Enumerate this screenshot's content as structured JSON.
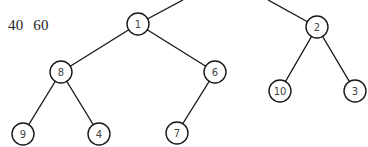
{
  "caption": "40  60",
  "tree": {
    "nodes": [
      {
        "id": "n1",
        "label": "1",
        "x": 138,
        "y": 24
      },
      {
        "id": "n2",
        "label": "2",
        "x": 317,
        "y": 27
      },
      {
        "id": "n8",
        "label": "8",
        "x": 61,
        "y": 72
      },
      {
        "id": "n6",
        "label": "6",
        "x": 215,
        "y": 72
      },
      {
        "id": "n10",
        "label": "10",
        "x": 280,
        "y": 91
      },
      {
        "id": "n3",
        "label": "3",
        "x": 355,
        "y": 91
      },
      {
        "id": "n9",
        "label": "9",
        "x": 23,
        "y": 134
      },
      {
        "id": "n4",
        "label": "4",
        "x": 99,
        "y": 134
      },
      {
        "id": "n7",
        "label": "7",
        "x": 177,
        "y": 133
      }
    ],
    "edges": [
      {
        "from": "n1",
        "to_point": [
          183,
          0
        ]
      },
      {
        "from": "n2",
        "to_point": [
          268,
          0
        ]
      },
      {
        "from": "n1",
        "to": "n8"
      },
      {
        "from": "n1",
        "to": "n6"
      },
      {
        "from": "n8",
        "to": "n9"
      },
      {
        "from": "n8",
        "to": "n4"
      },
      {
        "from": "n6",
        "to": "n7"
      },
      {
        "from": "n2",
        "to": "n10"
      },
      {
        "from": "n2",
        "to": "n3"
      }
    ],
    "radius": 11
  }
}
